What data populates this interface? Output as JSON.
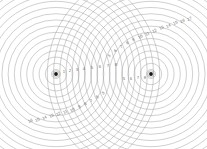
{
  "figure": {
    "background_color": "#ffffff",
    "line_color": "#9a9a9a",
    "label_color": "#6b6b6b",
    "source_dot_color": "#1a1a1a",
    "width": 207,
    "height": 149
  },
  "sources": [
    {
      "name": "source-left",
      "x": 56,
      "y": 74,
      "label": ""
    },
    {
      "name": "source-right",
      "x": 151,
      "y": 74,
      "label": ""
    }
  ],
  "waves": {
    "ring_count": 17,
    "ring_spacing": 6.2,
    "first_ring_radius": 4.5
  },
  "chart_data": {
    "type": "scatter",
    "xlabel": "",
    "ylabel": "",
    "grid": false,
    "legend": "none",
    "sources": [
      {
        "label": "S1",
        "x": 56,
        "y": 74
      },
      {
        "label": "S2",
        "x": 151,
        "y": 74
      }
    ],
    "series": [
      {
        "name": "rings-source-1",
        "center": [
          56,
          74
        ],
        "radii": [
          4.5,
          10.7,
          16.9,
          23.1,
          29.3,
          35.5,
          41.7,
          47.9,
          54.1,
          60.3,
          66.5,
          72.7,
          78.9,
          85.1,
          91.3,
          97.5,
          103.7
        ]
      },
      {
        "name": "rings-source-2",
        "center": [
          151,
          74
        ],
        "radii": [
          4.5,
          10.7,
          16.9,
          23.1,
          29.3,
          35.5,
          41.7,
          47.9,
          54.1,
          60.3,
          66.5,
          72.7,
          78.9,
          85.1,
          91.3,
          97.5,
          103.7
        ]
      }
    ],
    "annotations": [
      {
        "group": "inner-right-of-left-source",
        "values": [
          "1",
          "2",
          "3",
          "4",
          "5",
          "6",
          "7",
          "8"
        ]
      },
      {
        "group": "inner-left-of-right-source",
        "values": [
          "5",
          "6",
          "7",
          "8"
        ]
      },
      {
        "group": "upper-right-arc",
        "values": [
          "5",
          "6",
          "7",
          "8",
          "9",
          "10",
          "11",
          "12",
          "13",
          "14",
          "15",
          "16",
          "17"
        ]
      },
      {
        "group": "lower-left-arc",
        "values": [
          "16",
          "15",
          "14",
          "13",
          "12",
          "11",
          "10",
          "9",
          "8",
          "7",
          "6",
          "5"
        ]
      }
    ]
  },
  "labels": {
    "inner_left": [
      {
        "text": "1",
        "x": 64,
        "y": 73
      },
      {
        "text": "2",
        "x": 70,
        "y": 72
      },
      {
        "text": "3",
        "x": 77,
        "y": 71
      },
      {
        "text": "4",
        "x": 84,
        "y": 70
      },
      {
        "text": "5",
        "x": 92,
        "y": 69
      },
      {
        "text": "6",
        "x": 100,
        "y": 68
      },
      {
        "text": "7",
        "x": 108,
        "y": 67
      },
      {
        "text": "8",
        "x": 116,
        "y": 66
      }
    ],
    "inner_right": [
      {
        "text": "5",
        "x": 124,
        "y": 80
      },
      {
        "text": "6",
        "x": 131,
        "y": 80
      },
      {
        "text": "7",
        "x": 138,
        "y": 79
      },
      {
        "text": "8",
        "x": 145,
        "y": 79
      }
    ],
    "upper_arc": [
      {
        "text": "5",
        "x": 110,
        "y": 57,
        "rot": -32
      },
      {
        "text": "6",
        "x": 116,
        "y": 52,
        "rot": -32
      },
      {
        "text": "7",
        "x": 122,
        "y": 48,
        "rot": -32
      },
      {
        "text": "8",
        "x": 128,
        "y": 44,
        "rot": -30
      },
      {
        "text": "9",
        "x": 134,
        "y": 41,
        "rot": -30
      },
      {
        "text": "10",
        "x": 141,
        "y": 38,
        "rot": -28
      },
      {
        "text": "11",
        "x": 148,
        "y": 35,
        "rot": -28
      },
      {
        "text": "12",
        "x": 155,
        "y": 32,
        "rot": -26
      },
      {
        "text": "13",
        "x": 162,
        "y": 29,
        "rot": -26
      },
      {
        "text": "14",
        "x": 169,
        "y": 27,
        "rot": -24
      },
      {
        "text": "15",
        "x": 176,
        "y": 24,
        "rot": -24
      },
      {
        "text": "16",
        "x": 183,
        "y": 22,
        "rot": -22
      },
      {
        "text": "17",
        "x": 190,
        "y": 20,
        "rot": -22
      }
    ],
    "lower_arc": [
      {
        "text": "16",
        "x": 31,
        "y": 122,
        "rot": -24
      },
      {
        "text": "15",
        "x": 38,
        "y": 121,
        "rot": -24
      },
      {
        "text": "14",
        "x": 45,
        "y": 119,
        "rot": -25
      },
      {
        "text": "13",
        "x": 52,
        "y": 117,
        "rot": -26
      },
      {
        "text": "12",
        "x": 59,
        "y": 115,
        "rot": -27
      },
      {
        "text": "11",
        "x": 66,
        "y": 113,
        "rot": -28
      },
      {
        "text": "10",
        "x": 73,
        "y": 111,
        "rot": -29
      },
      {
        "text": "9",
        "x": 80,
        "y": 108,
        "rot": -30
      },
      {
        "text": "8",
        "x": 86,
        "y": 105,
        "rot": -31
      },
      {
        "text": "7",
        "x": 92,
        "y": 102,
        "rot": -32
      },
      {
        "text": "6",
        "x": 98,
        "y": 98,
        "rot": -33
      },
      {
        "text": "5",
        "x": 104,
        "y": 94,
        "rot": -34
      }
    ]
  }
}
